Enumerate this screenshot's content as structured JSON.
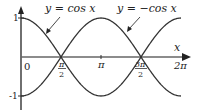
{
  "chart_data": {
    "type": "line",
    "title": "",
    "xlabel": "x",
    "ylabel": "",
    "xlim": [
      0,
      6.2832
    ],
    "ylim": [
      -1,
      1
    ],
    "grid": false,
    "x_ticks": [
      "0",
      "π/2",
      "π",
      "3π/2",
      "2π"
    ],
    "y_ticks": [
      "1",
      "-1"
    ],
    "x": [
      0,
      0.7854,
      1.5708,
      2.3562,
      3.1416,
      3.927,
      4.7124,
      5.4978,
      6.2832
    ],
    "series": [
      {
        "name": "y = cos x",
        "values": [
          1,
          0.707,
          0,
          -0.707,
          -1,
          -0.707,
          0,
          0.707,
          1
        ]
      },
      {
        "name": "y = −cos x",
        "values": [
          -1,
          -0.707,
          0,
          0.707,
          1,
          0.707,
          0,
          -0.707,
          -1
        ]
      }
    ],
    "annotations": [
      {
        "text": "y = cos x",
        "points_to": "cos x curve near x≈1"
      },
      {
        "text": "y = −cos x",
        "points_to": "−cos x curve near x≈4"
      }
    ]
  },
  "labels": {
    "cos_label": "y = cos x",
    "negcos_label": "y = −cos x",
    "x_axis": "x",
    "origin": "0",
    "y_one": "1",
    "y_neg_one": "-1",
    "pi": "π",
    "pi_half_num": "π",
    "pi_half_den": "2",
    "three_pi_half_num": "3π",
    "three_pi_half_den": "2",
    "two_pi": "2π"
  },
  "colors": {
    "curve": "#333333",
    "axis": "#555555",
    "text": "#222222"
  }
}
